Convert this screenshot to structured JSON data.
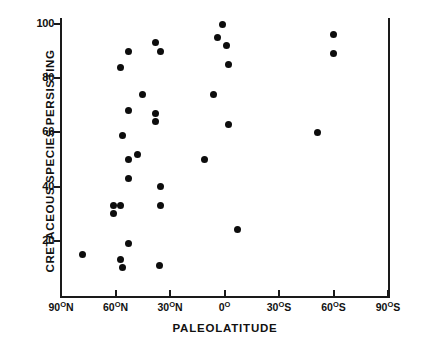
{
  "chart_data": {
    "type": "scatter",
    "title": "",
    "xlabel": "PALEOLATITUDE",
    "ylabel": "CRETACEOUS SPECIES PERSISTING",
    "xlim": [
      90,
      -90
    ],
    "ylim": [
      0,
      100
    ],
    "x_axis_direction": "north-to-south",
    "grid": false,
    "legend": null,
    "x_ticks": [
      {
        "value": 90,
        "label": "90",
        "sup": "O",
        "hemisphere": "N"
      },
      {
        "value": 60,
        "label": "60",
        "sup": "O",
        "hemisphere": "N"
      },
      {
        "value": 30,
        "label": "30",
        "sup": "O",
        "hemisphere": "N"
      },
      {
        "value": 0,
        "label": "0",
        "sup": "O",
        "hemisphere": ""
      },
      {
        "value": -30,
        "label": "30",
        "sup": "O",
        "hemisphere": "S"
      },
      {
        "value": -60,
        "label": "60",
        "sup": "O",
        "hemisphere": "S"
      },
      {
        "value": -90,
        "label": "90",
        "sup": "O",
        "hemisphere": "S"
      }
    ],
    "y_ticks": [
      {
        "value": 100,
        "label": "100"
      },
      {
        "value": 80,
        "label": "80"
      },
      {
        "value": 60,
        "label": "60"
      },
      {
        "value": 40,
        "label": "40"
      },
      {
        "value": 20,
        "label": "20"
      }
    ],
    "points": [
      {
        "x": 78,
        "y": 15
      },
      {
        "x": 61,
        "y": 30
      },
      {
        "x": 61,
        "y": 33
      },
      {
        "x": 57,
        "y": 33
      },
      {
        "x": 57,
        "y": 13
      },
      {
        "x": 56,
        "y": 10
      },
      {
        "x": 57,
        "y": 84
      },
      {
        "x": 56,
        "y": 59
      },
      {
        "x": 53,
        "y": 90
      },
      {
        "x": 53,
        "y": 68
      },
      {
        "x": 53,
        "y": 50
      },
      {
        "x": 53,
        "y": 43
      },
      {
        "x": 53,
        "y": 19
      },
      {
        "x": 48,
        "y": 52
      },
      {
        "x": 45,
        "y": 74
      },
      {
        "x": 38,
        "y": 93
      },
      {
        "x": 38,
        "y": 67
      },
      {
        "x": 38,
        "y": 64
      },
      {
        "x": 35,
        "y": 90
      },
      {
        "x": 35,
        "y": 40
      },
      {
        "x": 35,
        "y": 33
      },
      {
        "x": 36,
        "y": 11
      },
      {
        "x": 11,
        "y": 50
      },
      {
        "x": 4,
        "y": 95
      },
      {
        "x": 1,
        "y": 100
      },
      {
        "x": -1,
        "y": 92
      },
      {
        "x": -2,
        "y": 85
      },
      {
        "x": 6,
        "y": 74
      },
      {
        "x": -2,
        "y": 63
      },
      {
        "x": -7,
        "y": 24
      },
      {
        "x": -51,
        "y": 60
      },
      {
        "x": -60,
        "y": 96
      },
      {
        "x": -60,
        "y": 89
      }
    ]
  },
  "figure": {
    "axis_color": "#1a1a1a",
    "marker_color": "#0d0d0d",
    "background": "#ffffff"
  }
}
